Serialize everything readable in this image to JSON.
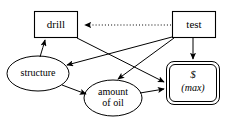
{
  "diagram": {
    "type": "influence-diagram",
    "colors": {
      "stroke": "#000000",
      "background": "#ffffff",
      "text": "#000000"
    },
    "nodes": [
      {
        "id": "drill",
        "label": "drill",
        "shape": "rectangle",
        "role": "decision",
        "x": 34,
        "y": 11,
        "w": 44,
        "h": 27
      },
      {
        "id": "test",
        "label": "test",
        "shape": "rectangle",
        "role": "decision",
        "x": 172,
        "y": 11,
        "w": 44,
        "h": 27
      },
      {
        "id": "structure",
        "label": "structure",
        "shape": "ellipse",
        "role": "chance",
        "x": 7,
        "y": 56,
        "w": 62,
        "h": 35
      },
      {
        "id": "amount_of_oil",
        "label_line1": "amount",
        "label_line2": "of oil",
        "shape": "ellipse",
        "role": "chance",
        "x": 84,
        "y": 80,
        "w": 58,
        "h": 36
      },
      {
        "id": "value",
        "label_line1": "$",
        "label_line2": "(max)",
        "shape": "double-rounded-rectangle",
        "role": "value",
        "x": 166,
        "y": 61,
        "w": 54,
        "h": 44
      }
    ],
    "edges": [
      {
        "from": "test",
        "to": "drill",
        "style": "dotted",
        "kind": "information-arc"
      },
      {
        "from": "test",
        "to": "structure",
        "style": "solid",
        "kind": "influence-arc"
      },
      {
        "from": "test",
        "to": "amount_of_oil",
        "style": "solid",
        "kind": "influence-arc"
      },
      {
        "from": "test",
        "to": "value",
        "style": "solid",
        "kind": "influence-arc"
      },
      {
        "from": "drill",
        "to": "value",
        "style": "solid",
        "kind": "influence-arc"
      },
      {
        "from": "structure",
        "to": "drill",
        "style": "solid",
        "kind": "influence-arc"
      },
      {
        "from": "structure",
        "to": "amount_of_oil",
        "style": "solid",
        "kind": "influence-arc"
      },
      {
        "from": "amount_of_oil",
        "to": "value",
        "style": "solid",
        "kind": "influence-arc"
      }
    ]
  }
}
